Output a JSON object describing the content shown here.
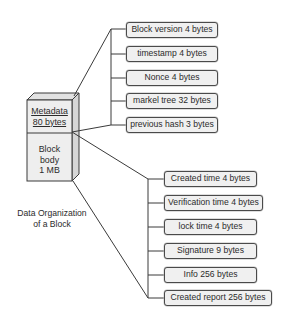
{
  "diagram": {
    "caption_line1": "Data Organization",
    "caption_line2": "of a Block",
    "block": {
      "metadata_line1": "Metadata",
      "metadata_line2": "80 bytes",
      "body_line1": "Block",
      "body_line2": "body",
      "body_line3": "1 MB"
    },
    "metadata_fields": [
      {
        "label": "Block version 4 bytes"
      },
      {
        "label": "timestamp 4 bytes"
      },
      {
        "label": "Nonce 4 bytes"
      },
      {
        "label": "markel tree 32 bytes"
      },
      {
        "label": "previous hash 3 bytes"
      }
    ],
    "body_fields": [
      {
        "label": "Created time 4 bytes"
      },
      {
        "label": "Verification time 4 bytes"
      },
      {
        "label": "lock time 4 bytes"
      },
      {
        "label": "Signature 9 bytes"
      },
      {
        "label": "Info 256 bytes"
      },
      {
        "label": "Created report 256 bytes"
      }
    ],
    "colors": {
      "line": "#3a3a3a",
      "box_fill": "#f0f0f0",
      "box_border": "#4a4a4a",
      "cube_front": "#eeeeee",
      "cube_top": "#e2e2e2",
      "cube_side": "#d6d6d6"
    }
  }
}
